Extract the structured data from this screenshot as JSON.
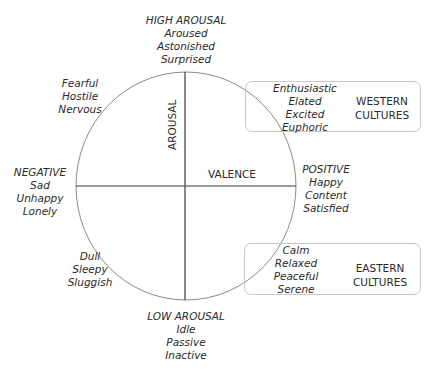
{
  "diagram": {
    "axes": {
      "vertical_label": "AROUSAL",
      "horizontal_label": "VALENCE"
    },
    "high_arousal": {
      "heading": "HIGH AROUSAL",
      "words": [
        "Aroused",
        "Astonished",
        "Surprised"
      ]
    },
    "low_arousal": {
      "heading": "LOW AROUSAL",
      "words": [
        "Idle",
        "Passive",
        "Inactive"
      ]
    },
    "negative": {
      "heading": "NEGATIVE",
      "words": [
        "Sad",
        "Unhappy",
        "Lonely"
      ]
    },
    "positive": {
      "heading": "POSITIVE",
      "words": [
        "Happy",
        "Content",
        "Satisfied"
      ]
    },
    "upper_left": {
      "words": [
        "Fearful",
        "Hostile",
        "Nervous"
      ]
    },
    "lower_left": {
      "words": [
        "Dull",
        "Sleepy",
        "Sluggish"
      ]
    },
    "upper_right": {
      "words": [
        "Enthusiastic",
        "Elated",
        "Excited",
        "Euphoric"
      ],
      "culture": [
        "WESTERN",
        "CULTURES"
      ]
    },
    "lower_right": {
      "words": [
        "Calm",
        "Relaxed",
        "Peaceful",
        "Serene"
      ],
      "culture": [
        "EASTERN",
        "CULTURES"
      ]
    },
    "colors": {
      "circle": "#8a8a8a",
      "axis": "#3a3a3a",
      "box_border": "#c8c8c8",
      "text": "#2a2a2a"
    }
  }
}
